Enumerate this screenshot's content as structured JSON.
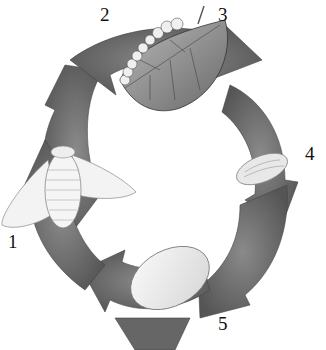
{
  "diagram": {
    "type": "life-cycle",
    "arrow_color": "#6e6e6e",
    "stages": [
      {
        "number": "1",
        "depiction": "adult moth"
      },
      {
        "number": "2",
        "depiction": "arrow segment"
      },
      {
        "number": "3",
        "depiction": "larva (caterpillar) on mulberry leaf"
      },
      {
        "number": "4",
        "depiction": "pupa"
      },
      {
        "number": "5",
        "depiction": "cocoon"
      }
    ]
  }
}
